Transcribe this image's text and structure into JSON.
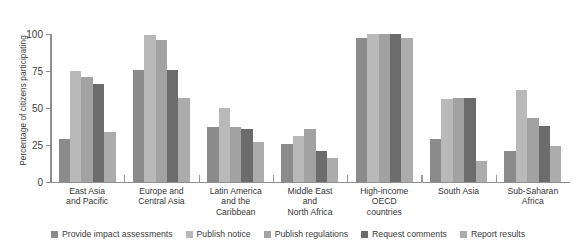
{
  "chart_data": {
    "type": "bar",
    "title": "",
    "xlabel": "",
    "ylabel": "Percentage of citizens participating",
    "ylim": [
      0,
      112
    ],
    "yticks": [
      0,
      25,
      50,
      75,
      100
    ],
    "ytick_labels": [
      "0",
      "25",
      "50",
      "75",
      "100"
    ],
    "grid": false,
    "legend_position": "bottom",
    "categories": [
      "East Asia\nand Pacific",
      "Europe and\nCentral Asia",
      "Latin America\nand the\nCaribbean",
      "Middle East\nand\nNorth Africa",
      "High-income\nOECD\ncountries",
      "South Asia",
      "Sub-Saharan\nAfrica"
    ],
    "category_lines": [
      [
        "East Asia",
        "and Pacific"
      ],
      [
        "Europe and",
        "Central Asia"
      ],
      [
        "Latin America",
        "and the",
        "Caribbean"
      ],
      [
        "Middle East",
        "and",
        "North Africa"
      ],
      [
        "High-income",
        "OECD",
        "countries"
      ],
      [
        "South Asia"
      ],
      [
        "Sub-Saharan",
        "Africa"
      ]
    ],
    "series": [
      {
        "name": "Provide impact assessments",
        "color": "#8b8b8b",
        "values": [
          29,
          76,
          37,
          26,
          97,
          29,
          21
        ]
      },
      {
        "name": "Publish notice",
        "color": "#b9b9b9",
        "values": [
          75,
          99,
          50,
          31,
          100,
          56,
          62
        ]
      },
      {
        "name": "Publish regulations",
        "color": "#a2a2a2",
        "values": [
          71,
          96,
          37,
          36,
          100,
          57,
          43
        ]
      },
      {
        "name": "Request comments",
        "color": "#6c6c6c",
        "values": [
          66,
          76,
          36,
          21,
          100,
          57,
          38
        ]
      },
      {
        "name": "Report results",
        "color": "#acacac",
        "values": [
          34,
          57,
          27,
          16,
          97,
          14,
          24
        ]
      }
    ]
  }
}
